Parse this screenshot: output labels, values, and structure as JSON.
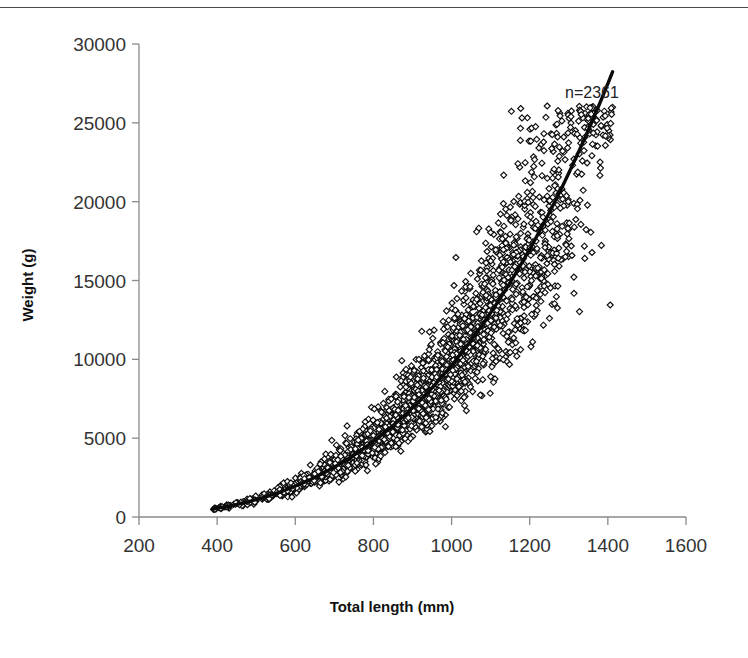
{
  "figure": {
    "annotation": "n=2361",
    "has_top_border": true
  },
  "chart_data": {
    "type": "scatter",
    "title": "",
    "xlabel": "Total length (mm)",
    "ylabel": "Weight (g)",
    "xlim": [
      200,
      1600
    ],
    "ylim": [
      0,
      30000
    ],
    "xticks": [
      200,
      400,
      600,
      800,
      1000,
      1200,
      1400,
      1600
    ],
    "xtick_labels": [
      "200",
      "400",
      "600",
      "800",
      "1000",
      "1200",
      "1400",
      "1600"
    ],
    "yticks": [
      0,
      5000,
      10000,
      15000,
      20000,
      25000,
      30000
    ],
    "ytick_labels": [
      "0",
      "5000",
      "10000",
      "15000",
      "20000",
      "25000",
      "30000"
    ],
    "grid": false,
    "legend": null,
    "n_points": 2361,
    "annotations": [
      {
        "text": "n=2361",
        "x": 1290,
        "y": 26200
      }
    ],
    "marker": {
      "shape": "diamond",
      "fill": "#ffffff",
      "edge_color": "#0d0d0d",
      "size": 5
    },
    "series": [
      {
        "name": "Length-weight observations",
        "marker": "open-diamond",
        "x_range": [
          385,
          1415
        ],
        "y_range": [
          300,
          24900
        ],
        "description": "Dense allometric scatter band widening with length",
        "fit_model": "W = a * L^b",
        "fit_a": 4.2e-06,
        "fit_b": 3.12,
        "scatter_cv": 0.17,
        "seed": 20240517,
        "length_distribution": {
          "mode": 960,
          "spread": 230,
          "min": 385,
          "max": 1415
        }
      }
    ],
    "fit_curve": {
      "name": "Fitted power curve",
      "color": "#0a0a0a",
      "x_start": 390,
      "x_end": 1412,
      "a": 4.2e-06,
      "b": 3.12,
      "y_start": 420,
      "y_end": 24700
    },
    "reference_points": [
      {
        "x": 400,
        "y": 520
      },
      {
        "x": 600,
        "y": 1900
      },
      {
        "x": 800,
        "y": 4700
      },
      {
        "x": 1000,
        "y": 9400
      },
      {
        "x": 1200,
        "y": 16500
      },
      {
        "x": 1400,
        "y": 24200
      }
    ]
  }
}
